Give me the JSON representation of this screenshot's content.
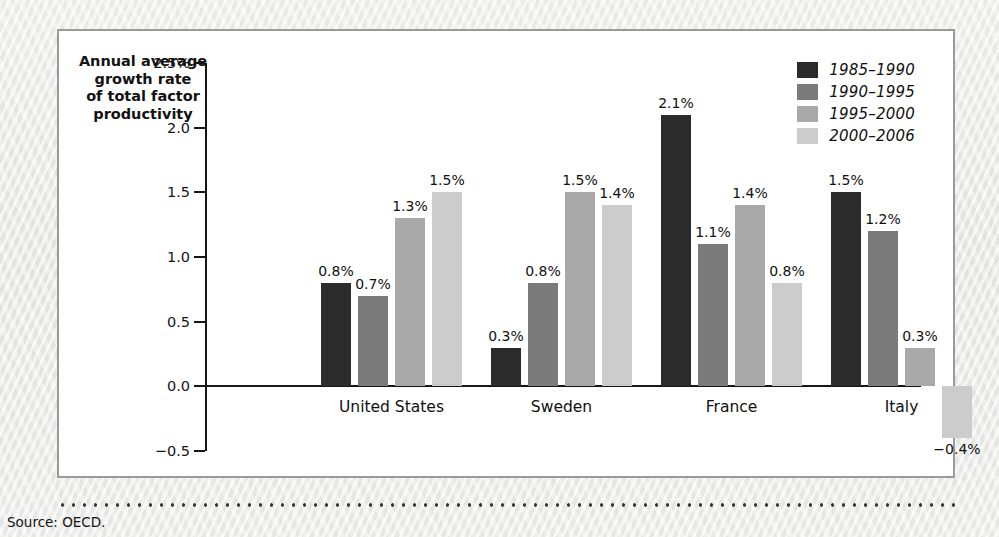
{
  "figure": {
    "axis_title": "Annual average\ngrowth rate\nof total factor\nproductivity",
    "source_note": "Source: OECD."
  },
  "colors": {
    "series_1985_1990": "#2b2b2b",
    "series_1990_1995": "#7b7b7b",
    "series_1995_2000": "#a9a9a9",
    "series_2000_2006": "#cccccc",
    "axis": "#161616",
    "panel_border": "#9a9a9a",
    "panel_background": "#ffffff",
    "page_background": "#e9e9e7"
  },
  "chart_data": {
    "type": "bar",
    "title": "",
    "xlabel": "",
    "ylabel": "Annual average growth rate of total factor productivity",
    "ylim": [
      -0.5,
      2.5
    ],
    "grid": false,
    "legend_position": "top-right",
    "ytick_labels": [
      "2.5%",
      "2.0",
      "1.5",
      "1.0",
      "0.5",
      "0.0",
      "-0.5"
    ],
    "ytick_values": [
      2.5,
      2.0,
      1.5,
      1.0,
      0.5,
      0.0,
      -0.5
    ],
    "categories": [
      "United States",
      "Sweden",
      "France",
      "Italy"
    ],
    "series": [
      {
        "name": "1985-1990",
        "color": "#2b2b2b",
        "values": [
          0.8,
          0.3,
          2.1,
          1.5
        ],
        "labels": [
          "0.8%",
          "0.3%",
          "2.1%",
          "1.5%"
        ]
      },
      {
        "name": "1990-1995",
        "color": "#7b7b7b",
        "values": [
          0.7,
          0.8,
          1.1,
          1.2
        ],
        "labels": [
          "0.7%",
          "0.8%",
          "1.1%",
          "1.2%"
        ]
      },
      {
        "name": "1995-2000",
        "color": "#a9a9a9",
        "values": [
          1.3,
          1.5,
          1.4,
          0.3
        ],
        "labels": [
          "1.3%",
          "1.5%",
          "1.4%",
          "0.3%"
        ]
      },
      {
        "name": "2000-2006",
        "color": "#cccccc",
        "values": [
          1.5,
          1.4,
          0.8,
          -0.4
        ],
        "labels": [
          "1.5%",
          "1.4%",
          "0.8%",
          "-0.4%"
        ]
      }
    ]
  }
}
